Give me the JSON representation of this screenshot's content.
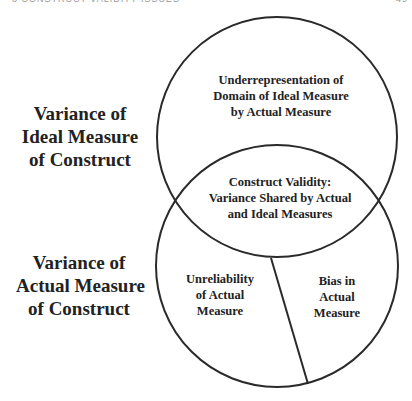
{
  "header": {
    "running_title": "3 CONSTRUCT VALIDITY ISSUES",
    "page_number": "49"
  },
  "diagram": {
    "colors": {
      "stroke": "#2a2a2a",
      "text": "#222222",
      "background": "#ffffff"
    },
    "circles": [
      {
        "name": "ideal-measure-circle",
        "cx": 277,
        "cy": 137,
        "r": 120
      },
      {
        "name": "actual-measure-circle",
        "cx": 277,
        "cy": 266,
        "r": 121
      }
    ],
    "divider_line": {
      "x1": 271,
      "y1": 258,
      "x2": 308,
      "y2": 384
    },
    "side_labels": {
      "ideal": {
        "lines": [
          "Variance of",
          "Ideal Measure",
          "of Construct"
        ]
      },
      "actual": {
        "lines": [
          "Variance of",
          "Actual Measure",
          "of Construct"
        ]
      }
    },
    "regions": {
      "underrepresentation": {
        "lines": [
          "Underrepresentation of",
          "Domain of Ideal Measure",
          "by Actual Measure"
        ]
      },
      "construct_validity": {
        "lines": [
          "Construct Validity:",
          "Variance Shared by Actual",
          "and Ideal Measures"
        ]
      },
      "unreliability": {
        "lines": [
          "Unreliability",
          "of Actual",
          "Measure"
        ]
      },
      "bias": {
        "lines": [
          "Bias in",
          "Actual",
          "Measure"
        ]
      }
    }
  }
}
